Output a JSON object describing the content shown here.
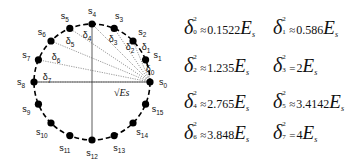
{
  "constellation": {
    "type": "16-PSK",
    "points": [
      "s0",
      "s1",
      "s2",
      "s3",
      "s4",
      "s5",
      "s6",
      "s7",
      "s8",
      "s9",
      "s10",
      "s11",
      "s12",
      "s13",
      "s14",
      "s15"
    ],
    "distances": [
      "δ0",
      "δ1",
      "δ2",
      "δ3",
      "δ4",
      "δ5",
      "δ6",
      "δ7"
    ],
    "radius_label": "√Es",
    "colors": {
      "points": "#000000",
      "circle": "#000000",
      "lines": "#555555"
    }
  },
  "equations": [
    {
      "index": "0",
      "relation": "≈",
      "value": "0.1522"
    },
    {
      "index": "1",
      "relation": "≈",
      "value": "0.586"
    },
    {
      "index": "2",
      "relation": "≈",
      "value": "1.235"
    },
    {
      "index": "3",
      "relation": "=",
      "value": "2"
    },
    {
      "index": "4",
      "relation": "≈",
      "value": "2.765"
    },
    {
      "index": "5",
      "relation": "≈",
      "value": "3.4142"
    },
    {
      "index": "6",
      "relation": "≈",
      "value": "3.848"
    },
    {
      "index": "7",
      "relation": "=",
      "value": "4"
    }
  ],
  "symbols": {
    "delta": "δ",
    "power": "2",
    "energy": "E",
    "energy_sub": "s"
  }
}
